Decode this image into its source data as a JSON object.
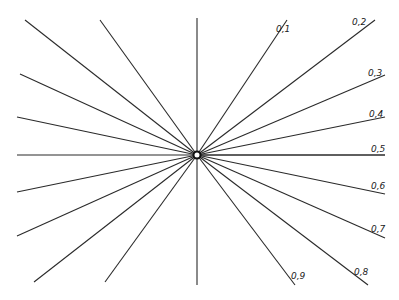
{
  "diagram": {
    "center": {
      "x": 197,
      "y": 155
    },
    "axes": {
      "horizontal": {
        "x1": 17,
        "y1": 155,
        "x2": 385,
        "y2": 155
      },
      "vertical": {
        "x1": 197,
        "y1": 18,
        "x2": 197,
        "y2": 285
      }
    },
    "labeled_rays": [
      {
        "label": "0,1",
        "x": 287,
        "y": 20,
        "lx": 276,
        "ly": 32
      },
      {
        "label": "0,2",
        "x": 375,
        "y": 20,
        "lx": 352,
        "ly": 25
      },
      {
        "label": "0,3",
        "x": 385,
        "y": 75,
        "lx": 368,
        "ly": 76
      },
      {
        "label": "0,4",
        "x": 385,
        "y": 117,
        "lx": 369,
        "ly": 117
      },
      {
        "label": "0,5",
        "x": 385,
        "y": 155,
        "lx": 371,
        "ly": 152
      },
      {
        "label": "0,6",
        "x": 385,
        "y": 194,
        "lx": 371,
        "ly": 189
      },
      {
        "label": "0,7",
        "x": 385,
        "y": 238,
        "lx": 371,
        "ly": 232
      },
      {
        "label": "0,8",
        "x": 368,
        "y": 285,
        "lx": 354,
        "ly": 275
      },
      {
        "label": "0,9",
        "x": 295,
        "y": 285,
        "lx": 291,
        "ly": 279
      }
    ],
    "unlabeled_rays": [
      {
        "x": 25,
        "y": 20
      },
      {
        "x": 100,
        "y": 20
      },
      {
        "x": 20,
        "y": 74
      },
      {
        "x": 17,
        "y": 117
      },
      {
        "x": 17,
        "y": 192
      },
      {
        "x": 17,
        "y": 236
      },
      {
        "x": 34,
        "y": 282
      },
      {
        "x": 105,
        "y": 282
      }
    ]
  }
}
